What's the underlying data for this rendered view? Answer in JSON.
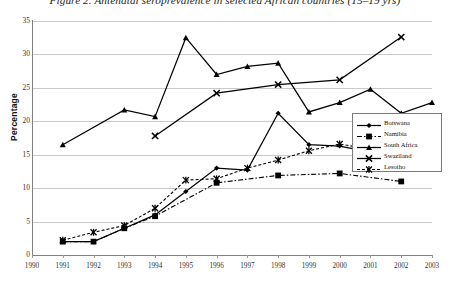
{
  "chart_data": {
    "type": "line",
    "title": "Figure 2. Antenatal seroprevalence in selected African countries (15–19 yrs)",
    "xlabel": "",
    "ylabel": "Percentage",
    "ylim": [
      0,
      35
    ],
    "ytick_step": 5,
    "yticks": [
      "0",
      "5",
      "10",
      "15",
      "20",
      "25",
      "30",
      "35"
    ],
    "x": [
      1990,
      1991,
      1992,
      1993,
      1994,
      1995,
      1996,
      1997,
      1998,
      1999,
      2000,
      2001,
      2002,
      2003
    ],
    "xticks": [
      "1990",
      "1991",
      "1992",
      "1993",
      "1994",
      "1995",
      "1996",
      "1997",
      "1998",
      "1999",
      "2000",
      "2001",
      "2002",
      "2003"
    ],
    "grid": true,
    "legend_position": "right",
    "series": [
      {
        "name": "Botswana",
        "marker": "diamond",
        "line": "solid",
        "color": "#000000",
        "points": [
          {
            "x": 1991,
            "y": 2.0
          },
          {
            "x": 1992,
            "y": 2.0
          },
          {
            "x": 1993,
            "y": 4.0
          },
          {
            "x": 1994,
            "y": 6.0
          },
          {
            "x": 1995,
            "y": 9.5
          },
          {
            "x": 1996,
            "y": 13.0
          },
          {
            "x": 1997,
            "y": 12.7
          },
          {
            "x": 1998,
            "y": 21.2
          },
          {
            "x": 1999,
            "y": 16.5
          },
          {
            "x": 2000,
            "y": 16.3
          },
          {
            "x": 2001,
            "y": 15.4
          },
          {
            "x": 2002,
            "y": 15.0
          },
          {
            "x": 2003,
            "y": 16.0
          }
        ]
      },
      {
        "name": "Namibia",
        "marker": "square",
        "line": "dashdot",
        "color": "#000000",
        "points": [
          {
            "x": 1991,
            "y": 2.0
          },
          {
            "x": 1992,
            "y": 2.0
          },
          {
            "x": 1993,
            "y": 4.0
          },
          {
            "x": 1994,
            "y": 5.8
          },
          {
            "x": 1996,
            "y": 10.8
          },
          {
            "x": 1998,
            "y": 11.9
          },
          {
            "x": 2000,
            "y": 12.2
          },
          {
            "x": 2002,
            "y": 11.0
          }
        ]
      },
      {
        "name": "South Africa",
        "marker": "triangle",
        "line": "solid",
        "color": "#000000",
        "points": [
          {
            "x": 1991,
            "y": 16.5
          },
          {
            "x": 1993,
            "y": 21.7
          },
          {
            "x": 1994,
            "y": 20.7
          },
          {
            "x": 1995,
            "y": 32.5
          },
          {
            "x": 1996,
            "y": 27.0
          },
          {
            "x": 1997,
            "y": 28.2
          },
          {
            "x": 1998,
            "y": 28.7
          },
          {
            "x": 1999,
            "y": 21.4
          },
          {
            "x": 2000,
            "y": 22.8
          },
          {
            "x": 2001,
            "y": 24.8
          },
          {
            "x": 2002,
            "y": 21.2
          },
          {
            "x": 2003,
            "y": 22.8
          }
        ]
      },
      {
        "name": "Swaziland",
        "marker": "cross",
        "line": "solid",
        "color": "#000000",
        "points": [
          {
            "x": 1994,
            "y": 17.8
          },
          {
            "x": 1996,
            "y": 24.2
          },
          {
            "x": 1998,
            "y": 25.5
          },
          {
            "x": 2000,
            "y": 26.2
          },
          {
            "x": 2002,
            "y": 32.6
          }
        ]
      },
      {
        "name": "Lesotho",
        "marker": "asterisk",
        "line": "dashed",
        "color": "#000000",
        "points": [
          {
            "x": 1991,
            "y": 2.2
          },
          {
            "x": 1992,
            "y": 3.4
          },
          {
            "x": 1993,
            "y": 4.4
          },
          {
            "x": 1994,
            "y": 7.0
          },
          {
            "x": 1995,
            "y": 11.2
          },
          {
            "x": 1996,
            "y": 11.4
          },
          {
            "x": 1997,
            "y": 13.0
          },
          {
            "x": 1998,
            "y": 14.2
          },
          {
            "x": 1999,
            "y": 15.6
          },
          {
            "x": 2000,
            "y": 16.6
          },
          {
            "x": 2001,
            "y": 15.8
          },
          {
            "x": 2002,
            "y": 15.0
          },
          {
            "x": 2003,
            "y": 15.6
          }
        ]
      }
    ]
  },
  "legend": {
    "items": [
      {
        "label": "Botswana"
      },
      {
        "label": "Namibia"
      },
      {
        "label": "South Africa"
      },
      {
        "label": "Swaziland"
      },
      {
        "label": "Lesotho"
      }
    ]
  }
}
